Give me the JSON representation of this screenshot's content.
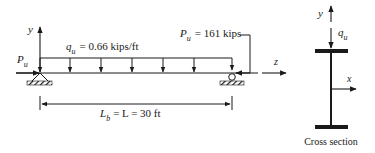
{
  "beam": {
    "axis_y": "y",
    "axis_z": "z",
    "left_axial_load": {
      "symbol": "P",
      "subscript": "u"
    },
    "distributed_load": {
      "symbol": "q",
      "subscript": "u",
      "value_text": "= 0.66 kips/ft"
    },
    "right_axial_load": {
      "symbol": "P",
      "subscript": "u",
      "value_text": "= 161 kips"
    },
    "span": {
      "symbol": "L",
      "subscript": "b",
      "value_text": "= L = 30 ft"
    }
  },
  "cross_section": {
    "axis_y": "y",
    "axis_x": "x",
    "load": {
      "symbol": "q",
      "subscript": "u"
    },
    "caption": "Cross section"
  },
  "colors": {
    "ink": "#1a1a1a",
    "background": "#ffffff"
  }
}
